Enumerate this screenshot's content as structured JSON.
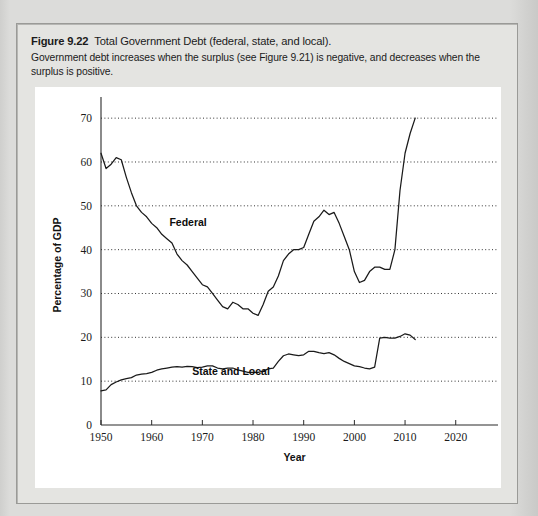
{
  "figure": {
    "number": "Figure 9.22",
    "title": "Total Government Debt (federal, state, and local).",
    "description": "Government debt increases when the surplus (see Figure 9.21) is negative, and decreases when the surplus is positive."
  },
  "colors": {
    "page_background": "#d9d9d7",
    "card_background": "#e4e4e1",
    "plot_background": "#ffffff",
    "line": "#1a1a1a",
    "grid": "#333333"
  },
  "chart_data": {
    "type": "line",
    "title": "Total Government Debt (federal, state, and local).",
    "xlabel": "Year",
    "ylabel": "Percentage of GDP",
    "xlim": [
      1950,
      2024
    ],
    "ylim": [
      0,
      73
    ],
    "xticks": [
      1950,
      1960,
      1970,
      1980,
      1990,
      2000,
      2010,
      2020
    ],
    "yticks": [
      0,
      10,
      20,
      30,
      40,
      50,
      60,
      70
    ],
    "xtick_labels": [
      "1950",
      "1960",
      "1970",
      "1980",
      "1990",
      "2000",
      "2010",
      "2020"
    ],
    "ytick_labels": [
      "0",
      "10",
      "20",
      "30",
      "40",
      "50",
      "60",
      "70"
    ],
    "grid": "horizontal-dotted",
    "legend": "inline-labels",
    "series": [
      {
        "name": "Federal",
        "label_position": {
          "x": 1963.5,
          "y": 45.5
        },
        "x": [
          1950,
          1951,
          1952,
          1953,
          1954,
          1955,
          1956,
          1957,
          1958,
          1959,
          1960,
          1961,
          1962,
          1963,
          1964,
          1965,
          1966,
          1967,
          1968,
          1969,
          1970,
          1971,
          1972,
          1973,
          1974,
          1975,
          1976,
          1977,
          1978,
          1979,
          1980,
          1981,
          1982,
          1983,
          1984,
          1985,
          1986,
          1987,
          1988,
          1989,
          1990,
          1991,
          1992,
          1993,
          1994,
          1995,
          1996,
          1997,
          1998,
          1999,
          2000,
          2001,
          2002,
          2003,
          2004,
          2005,
          2006,
          2007,
          2008,
          2009,
          2010,
          2011,
          2012
        ],
        "values": [
          62.0,
          58.5,
          59.5,
          61.0,
          60.5,
          56.5,
          53.0,
          50.0,
          48.5,
          47.5,
          46.0,
          45.0,
          43.5,
          42.5,
          41.5,
          39.0,
          37.5,
          36.5,
          35.0,
          33.5,
          32.0,
          31.5,
          30.0,
          28.5,
          27.0,
          26.5,
          28.0,
          27.5,
          26.5,
          26.5,
          25.5,
          25.0,
          27.5,
          30.5,
          31.5,
          34.0,
          37.5,
          39.0,
          40.0,
          40.0,
          40.5,
          43.5,
          46.5,
          47.5,
          49.0,
          48.0,
          48.5,
          46.0,
          43.0,
          40.0,
          35.0,
          32.5,
          33.0,
          35.0,
          36.0,
          36.0,
          35.5,
          35.5,
          40.0,
          53.5,
          62.0,
          66.5,
          70.0
        ]
      },
      {
        "name": "State and Local",
        "label_position": {
          "x": 1968.0,
          "y": 11.3
        },
        "x": [
          1950,
          1951,
          1952,
          1953,
          1954,
          1955,
          1956,
          1957,
          1958,
          1959,
          1960,
          1961,
          1962,
          1963,
          1964,
          1965,
          1966,
          1967,
          1968,
          1969,
          1970,
          1971,
          1972,
          1973,
          1974,
          1975,
          1976,
          1977,
          1978,
          1979,
          1980,
          1981,
          1982,
          1983,
          1984,
          1985,
          1986,
          1987,
          1988,
          1989,
          1990,
          1991,
          1992,
          1993,
          1994,
          1995,
          1996,
          1997,
          1998,
          1999,
          2000,
          2001,
          2002,
          2003,
          2004,
          2005,
          2006,
          2007,
          2008,
          2009,
          2010,
          2011,
          2012
        ],
        "values": [
          7.8,
          8.0,
          9.2,
          9.8,
          10.3,
          10.6,
          10.8,
          11.4,
          11.6,
          11.7,
          12.0,
          12.5,
          12.8,
          13.0,
          13.2,
          13.3,
          13.2,
          13.4,
          13.3,
          13.1,
          13.2,
          13.5,
          13.5,
          13.0,
          12.8,
          13.0,
          13.0,
          12.6,
          12.3,
          12.0,
          12.0,
          12.0,
          12.3,
          12.8,
          13.0,
          14.5,
          15.8,
          16.2,
          16.0,
          15.8,
          16.0,
          16.8,
          16.8,
          16.5,
          16.3,
          16.5,
          16.0,
          15.2,
          14.5,
          14.0,
          13.5,
          13.3,
          13.0,
          12.8,
          13.2,
          19.8,
          20.0,
          19.8,
          19.8,
          20.2,
          20.8,
          20.5,
          19.5
        ]
      }
    ]
  }
}
